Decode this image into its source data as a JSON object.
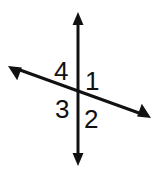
{
  "figure": {
    "kind": "intersecting-lines-angle-diagram",
    "background_color": "#ffffff",
    "stroke_color": "#111111",
    "stroke_width": 3,
    "width": 162,
    "height": 177,
    "intersection": {
      "x": 78,
      "y": 92
    },
    "lines": [
      {
        "name": "vertical-line",
        "arrowheads": "both",
        "from": {
          "x": 78,
          "y": 166
        },
        "to": {
          "x": 78,
          "y": 12
        }
      },
      {
        "name": "slanted-line",
        "arrowheads": "both",
        "from": {
          "x": 8,
          "y": 66
        },
        "to": {
          "x": 151,
          "y": 118
        }
      }
    ],
    "arrowhead": {
      "width": 11,
      "length": 13
    },
    "labels": [
      {
        "id": "1",
        "text": "1",
        "region": "upper-right",
        "x": 85,
        "y": 68
      },
      {
        "id": "2",
        "text": "2",
        "region": "lower-right",
        "x": 84,
        "y": 106
      },
      {
        "id": "3",
        "text": "3",
        "region": "lower-left",
        "x": 55,
        "y": 96
      },
      {
        "id": "4",
        "text": "4",
        "region": "upper-left",
        "x": 54,
        "y": 58
      }
    ],
    "label_color": "#111111",
    "label_font_size": 26
  }
}
